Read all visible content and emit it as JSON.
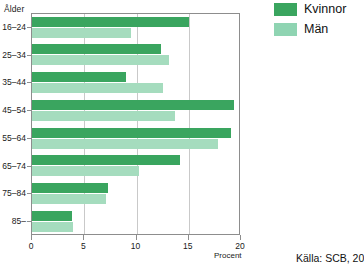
{
  "chart_data": {
    "type": "bar",
    "orientation": "horizontal",
    "title": "",
    "xlabel": "Procent",
    "ylabel": "Ålder",
    "xlim": [
      0,
      20
    ],
    "xticks": [
      0,
      5,
      10,
      15,
      20
    ],
    "xtick_labels": [
      "0",
      "5",
      "10",
      "15",
      "20"
    ],
    "grid": "vertical",
    "legend_position": "top-right",
    "categories": [
      "16–24",
      "25–34",
      "35–44",
      "45–54",
      "55–64",
      "65–74",
      "75–84",
      "85–"
    ],
    "series": [
      {
        "name": "Kvinnor",
        "color": "#3aa55f",
        "values": [
          15.0,
          12.3,
          9.0,
          19.3,
          19.0,
          14.2,
          7.3,
          3.8
        ]
      },
      {
        "name": "Män",
        "color": "#a5dcbe",
        "values": [
          9.5,
          13.1,
          12.5,
          13.7,
          17.8,
          10.2,
          7.1,
          3.9
        ]
      }
    ]
  },
  "axis": {
    "y_title": "Ålder",
    "x_title": "Procent"
  },
  "legend": {
    "items": [
      {
        "label": "Kvinnor",
        "color": "#3aa55f"
      },
      {
        "label": "Män",
        "color": "#8fd4b2"
      }
    ]
  },
  "source": {
    "text": "Källa: SCB, 20"
  },
  "colors": {
    "kvinnor": "#3aa55f",
    "man": "#a5dcbe",
    "axis": "#8d8d8d",
    "grid": "#c9c9c9",
    "text": "#1a1a1a"
  }
}
